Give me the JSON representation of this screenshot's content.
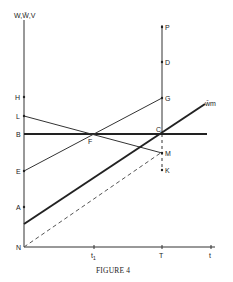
{
  "figure": {
    "caption": "Figure 4",
    "caption_display": "FIGURE 4",
    "y_axis_label": "W,W̄,V",
    "x_axis_label": "t",
    "curve_label": "w̄m",
    "x_ticks": [
      {
        "label": "t₁",
        "sub": "1",
        "x": 94
      },
      {
        "label": "T",
        "x": 162
      },
      {
        "label": "t",
        "x": 211
      }
    ],
    "left_axis_points": [
      {
        "label": "H",
        "y": 97
      },
      {
        "label": "L",
        "y": 116
      },
      {
        "label": "B",
        "y": 134
      },
      {
        "label": "E",
        "y": 171
      },
      {
        "label": "A",
        "y": 207
      },
      {
        "label": "N",
        "y": 247
      }
    ],
    "vertical_T_points": [
      {
        "label": "P",
        "y": 27
      },
      {
        "label": "D",
        "y": 62
      },
      {
        "label": "G",
        "y": 98
      },
      {
        "label": "C",
        "y": 134
      },
      {
        "label": "M",
        "y": 153
      },
      {
        "label": "K",
        "y": 170
      }
    ],
    "intersection_label": "F",
    "lines": [
      {
        "name": "B-horizontal",
        "from": "B",
        "to": "beyond C",
        "style": "thick"
      },
      {
        "name": "L-M",
        "from": "L",
        "to": "M",
        "style": "thin"
      },
      {
        "name": "E-G",
        "from": "E",
        "to": "G",
        "style": "thin"
      },
      {
        "name": "wm-line",
        "from": "above N on axis",
        "to": "w̄m",
        "style": "thick"
      },
      {
        "name": "N-dashed",
        "from": "N",
        "to": "below C",
        "style": "dashed"
      }
    ]
  }
}
